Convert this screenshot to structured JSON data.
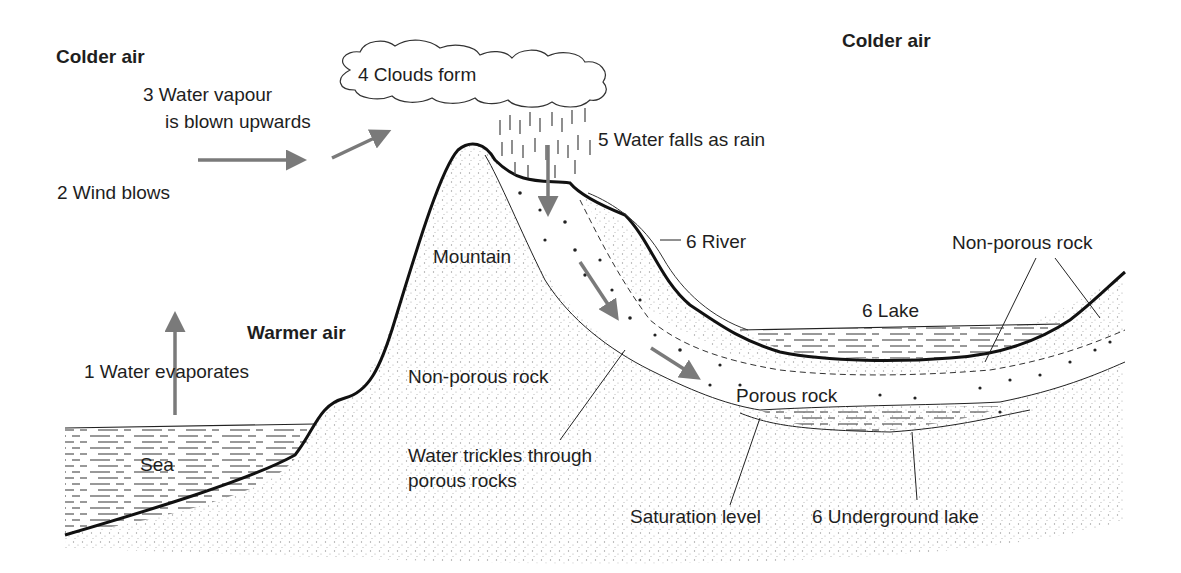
{
  "labels": {
    "colder_air_left": "Colder air",
    "colder_air_right": "Colder air",
    "warmer_air": "Warmer air",
    "step1": "1 Water evaporates",
    "step2": "2 Wind blows",
    "step3_line1": "3 Water vapour",
    "step3_line2": "is blown upwards",
    "step4": "4 Clouds form",
    "step5": "5 Water falls as rain",
    "river": "6 River",
    "lake": "6 Lake",
    "underground_lake": "6 Underground lake",
    "sea": "Sea",
    "mountain": "Mountain",
    "non_porous_rock_left": "Non-porous rock",
    "non_porous_rock_right": "Non-porous rock",
    "porous_rock": "Porous rock",
    "trickle_line1": "Water trickles through",
    "trickle_line2": "porous rocks",
    "saturation_level": "Saturation level"
  },
  "colors": {
    "outline": "#111111",
    "arrow": "#7a7a7a",
    "stipple": "#9a9a9a",
    "water_dash": "#444444",
    "background": "#ffffff"
  }
}
